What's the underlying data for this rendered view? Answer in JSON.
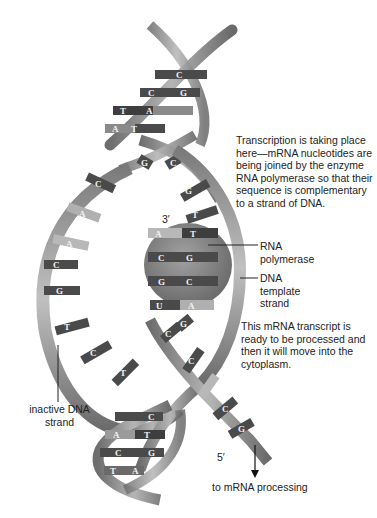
{
  "diagram": {
    "annotations": {
      "transcription": "Transcription is taking place\nhere—mRNA nucleotides are\nbeing joined by the enzyme\nRNA polymerase so that their\nsequence is complementary\nto a strand of DNA.",
      "rna_polymerase": "RNA\npolymerase",
      "dna_template": "DNA\ntemplate\nstrand",
      "mrna_transcript": "This mRNA transcript is\nready to be processed and\nthen it will move into the\ncytoplasm.",
      "inactive_strand": "inactive DNA\nstrand",
      "prime3": "3′",
      "prime5": "5′",
      "to_processing": "to mRNA processing"
    },
    "top_helix_pairs": [
      [
        "",
        "C"
      ],
      [
        "C",
        "G"
      ],
      [
        "T",
        "A"
      ],
      [
        "A",
        "T"
      ]
    ],
    "crossover_pairs": [
      [
        "G",
        "C"
      ]
    ],
    "inactive_strand_bases": [
      "C",
      "A",
      "A",
      "C",
      "G",
      "T",
      "C",
      "T"
    ],
    "template_strand_bases": [
      "G",
      "T",
      "T",
      "G",
      "C",
      "C",
      "A",
      "G"
    ],
    "mrna_bases": [
      "A",
      "C",
      "G",
      "U",
      "C"
    ],
    "mrna_tail_bases": [
      "C",
      "A",
      "C",
      "G"
    ],
    "bottom_helix_pairs": [
      [
        "",
        "C"
      ],
      [
        "A",
        "T"
      ],
      [
        "C",
        "G"
      ],
      [
        "T",
        "A"
      ]
    ],
    "colors": {
      "backbone": "#8c8c8c",
      "backbone_dark": "#5a5a5a",
      "base_dark": "#4a4a4a",
      "base_light": "#b8b8b8",
      "polymerase": "#7a7a7a",
      "text": "#222222"
    }
  }
}
